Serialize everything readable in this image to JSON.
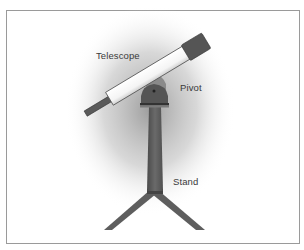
{
  "diagram": {
    "labels": {
      "telescope": "Telescope",
      "pivot": "Pivot",
      "stand": "Stand"
    },
    "colors": {
      "tube": "#ffffff",
      "tube_outline": "#555555",
      "cap": "#555555",
      "eyepiece": "#5a5a5a",
      "pivot": "#555555",
      "stand": "#5e5e5e",
      "shadow": "#9c9c9c",
      "frame_border": "#9a9a9a"
    }
  }
}
